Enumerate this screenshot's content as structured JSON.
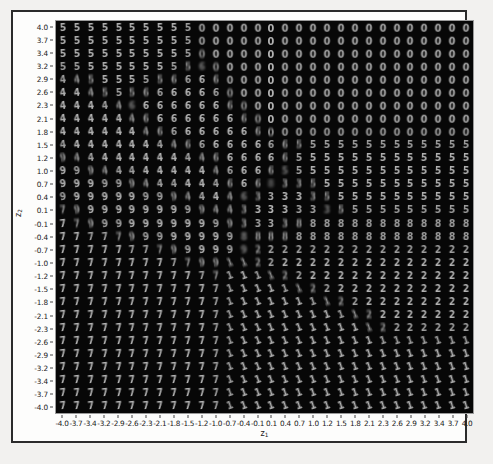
{
  "figure": {
    "background_color": "#fdfdfc",
    "frame_color": "#2b2b2b",
    "plot_background_color": "#000000"
  },
  "axes": {
    "xlabel": "z1",
    "xlabel_base": "z",
    "xlabel_sub": "1",
    "ylabel": "z2",
    "ylabel_base": "z",
    "ylabel_sub": "2"
  },
  "chart_data": {
    "type": "heatmap",
    "title": "",
    "subtitle": "",
    "xlabel": "z1",
    "ylabel": "z2",
    "grid": false,
    "legend": "none",
    "xlim": [
      -4.0,
      4.0
    ],
    "ylim": [
      -4.0,
      4.0
    ],
    "rows": 30,
    "cols": 30,
    "x_tick_labels": [
      "-4.0",
      "-3.7",
      "-3.4",
      "-3.2",
      "-2.9",
      "-2.6",
      "-2.3",
      "-2.1",
      "-1.8",
      "-1.5",
      "-1.2",
      "-1.0",
      "-0.7",
      "-0.4",
      "-0.1",
      "0.1",
      "0.4",
      "0.7",
      "1.0",
      "1.2",
      "1.5",
      "1.8",
      "2.1",
      "2.3",
      "2.6",
      "2.9",
      "3.2",
      "3.4",
      "3.7",
      "4.0"
    ],
    "y_tick_labels": [
      "4.0",
      "3.7",
      "3.4",
      "3.2",
      "2.9",
      "2.6",
      "2.3",
      "2.1",
      "1.8",
      "1.5",
      "1.2",
      "1.0",
      "0.7",
      "0.4",
      "0.1",
      "-0.1",
      "-0.4",
      "-0.7",
      "-1.0",
      "-1.2",
      "-1.5",
      "-1.8",
      "-2.1",
      "-2.3",
      "-2.6",
      "-2.9",
      "-3.2",
      "-3.4",
      "-3.7",
      "-4.0"
    ],
    "x_tick_values": [
      -4.0,
      -3.7,
      -3.4,
      -3.2,
      -2.9,
      -2.6,
      -2.3,
      -2.1,
      -1.8,
      -1.5,
      -1.2,
      -1.0,
      -0.7,
      -0.4,
      -0.1,
      0.1,
      0.4,
      0.7,
      1.0,
      1.2,
      1.5,
      1.8,
      2.1,
      2.3,
      2.6,
      2.9,
      3.2,
      3.4,
      3.7,
      4.0
    ],
    "y_tick_values": [
      4.0,
      3.7,
      3.4,
      3.2,
      2.9,
      2.6,
      2.3,
      2.1,
      1.8,
      1.5,
      1.2,
      1.0,
      0.7,
      0.4,
      0.1,
      -0.1,
      -0.4,
      -0.7,
      -1.0,
      -1.2,
      -1.5,
      -1.8,
      -2.1,
      -2.3,
      -2.6,
      -2.9,
      -3.2,
      -3.4,
      -3.7,
      -4.0
    ],
    "digit_grid": [
      [
        "5",
        "5",
        "5",
        "5",
        "5",
        "5",
        "5",
        "5",
        "5",
        "5",
        "0",
        "0",
        "0",
        "0",
        "0",
        "0",
        "0",
        "0",
        "0",
        "0",
        "0",
        "0",
        "0",
        "0",
        "0",
        "0",
        "0",
        "0",
        "0",
        "0"
      ],
      [
        "5",
        "5",
        "5",
        "5",
        "5",
        "5",
        "5",
        "5",
        "5",
        "5",
        "0",
        "0",
        "0",
        "0",
        "0",
        "0",
        "0",
        "0",
        "0",
        "0",
        "0",
        "0",
        "0",
        "0",
        "0",
        "0",
        "0",
        "0",
        "0",
        "0"
      ],
      [
        "5",
        "5",
        "5",
        "5",
        "5",
        "5",
        "5",
        "5",
        "5",
        "5",
        "0",
        "0",
        "0",
        "0",
        "0",
        "0",
        "0",
        "0",
        "0",
        "0",
        "0",
        "0",
        "0",
        "0",
        "0",
        "0",
        "0",
        "0",
        "0",
        "0"
      ],
      [
        "5",
        "5",
        "5",
        "5",
        "5",
        "5",
        "5",
        "5",
        "5",
        "5",
        "6",
        "0",
        "0",
        "0",
        "0",
        "0",
        "0",
        "0",
        "0",
        "0",
        "0",
        "0",
        "0",
        "0",
        "0",
        "0",
        "0",
        "0",
        "0",
        "0"
      ],
      [
        "4",
        "4",
        "5",
        "5",
        "5",
        "5",
        "5",
        "5",
        "6",
        "6",
        "6",
        "6",
        "0",
        "0",
        "0",
        "0",
        "0",
        "0",
        "0",
        "0",
        "0",
        "0",
        "0",
        "0",
        "0",
        "0",
        "0",
        "0",
        "0",
        "0"
      ],
      [
        "4",
        "4",
        "4",
        "5",
        "5",
        "5",
        "6",
        "6",
        "6",
        "6",
        "6",
        "6",
        "0",
        "0",
        "0",
        "0",
        "0",
        "0",
        "0",
        "0",
        "0",
        "0",
        "0",
        "0",
        "0",
        "0",
        "0",
        "0",
        "0",
        "0"
      ],
      [
        "4",
        "4",
        "4",
        "4",
        "4",
        "6",
        "6",
        "6",
        "6",
        "6",
        "6",
        "6",
        "6",
        "0",
        "0",
        "0",
        "0",
        "0",
        "0",
        "0",
        "0",
        "0",
        "0",
        "0",
        "0",
        "0",
        "0",
        "0",
        "0",
        "0"
      ],
      [
        "4",
        "4",
        "4",
        "4",
        "4",
        "4",
        "6",
        "6",
        "6",
        "6",
        "6",
        "6",
        "6",
        "6",
        "0",
        "0",
        "0",
        "0",
        "0",
        "0",
        "0",
        "0",
        "0",
        "0",
        "0",
        "0",
        "0",
        "0",
        "0",
        "0"
      ],
      [
        "4",
        "4",
        "4",
        "4",
        "4",
        "4",
        "4",
        "6",
        "6",
        "6",
        "6",
        "6",
        "6",
        "6",
        "6",
        "0",
        "0",
        "0",
        "0",
        "0",
        "0",
        "0",
        "0",
        "0",
        "0",
        "0",
        "0",
        "0",
        "0",
        "0"
      ],
      [
        "4",
        "4",
        "4",
        "4",
        "4",
        "4",
        "4",
        "4",
        "4",
        "6",
        "6",
        "6",
        "6",
        "6",
        "6",
        "6",
        "6",
        "5",
        "5",
        "5",
        "5",
        "5",
        "5",
        "5",
        "5",
        "5",
        "5",
        "5",
        "5",
        "5"
      ],
      [
        "9",
        "4",
        "4",
        "4",
        "4",
        "4",
        "4",
        "4",
        "4",
        "4",
        "4",
        "6",
        "6",
        "6",
        "6",
        "6",
        "6",
        "5",
        "5",
        "5",
        "5",
        "5",
        "5",
        "5",
        "5",
        "5",
        "5",
        "5",
        "5",
        "5"
      ],
      [
        "9",
        "9",
        "9",
        "4",
        "4",
        "4",
        "4",
        "4",
        "4",
        "4",
        "4",
        "4",
        "6",
        "6",
        "6",
        "6",
        "5",
        "5",
        "5",
        "5",
        "5",
        "5",
        "5",
        "5",
        "5",
        "5",
        "5",
        "5",
        "5",
        "5"
      ],
      [
        "9",
        "9",
        "9",
        "9",
        "9",
        "9",
        "4",
        "4",
        "4",
        "4",
        "4",
        "4",
        "6",
        "6",
        "6",
        "8",
        "3",
        "3",
        "5",
        "5",
        "5",
        "5",
        "5",
        "5",
        "5",
        "5",
        "5",
        "5",
        "5",
        "5"
      ],
      [
        "9",
        "9",
        "9",
        "9",
        "9",
        "9",
        "9",
        "9",
        "9",
        "4",
        "4",
        "4",
        "4",
        "6",
        "3",
        "3",
        "3",
        "3",
        "3",
        "5",
        "5",
        "5",
        "5",
        "5",
        "5",
        "5",
        "5",
        "5",
        "5",
        "5"
      ],
      [
        "7",
        "9",
        "9",
        "9",
        "9",
        "9",
        "9",
        "9",
        "9",
        "9",
        "9",
        "4",
        "4",
        "3",
        "3",
        "3",
        "3",
        "3",
        "3",
        "3",
        "5",
        "5",
        "5",
        "5",
        "5",
        "5",
        "5",
        "5",
        "5",
        "5"
      ],
      [
        "7",
        "7",
        "9",
        "9",
        "9",
        "9",
        "9",
        "9",
        "9",
        "9",
        "9",
        "9",
        "9",
        "3",
        "3",
        "3",
        "3",
        "8",
        "8",
        "8",
        "8",
        "8",
        "8",
        "8",
        "8",
        "8",
        "8",
        "8",
        "8",
        "8"
      ],
      [
        "7",
        "7",
        "7",
        "7",
        "7",
        "9",
        "9",
        "9",
        "9",
        "9",
        "9",
        "9",
        "9",
        "8",
        "8",
        "8",
        "8",
        "8",
        "8",
        "8",
        "8",
        "8",
        "8",
        "8",
        "8",
        "8",
        "8",
        "8",
        "8",
        "8"
      ],
      [
        "7",
        "7",
        "7",
        "7",
        "7",
        "7",
        "7",
        "7",
        "9",
        "9",
        "9",
        "9",
        "9",
        "9",
        "2",
        "2",
        "2",
        "2",
        "2",
        "2",
        "2",
        "2",
        "2",
        "2",
        "2",
        "2",
        "2",
        "2",
        "2",
        "2"
      ],
      [
        "7",
        "7",
        "7",
        "7",
        "7",
        "7",
        "7",
        "7",
        "7",
        "7",
        "9",
        "9",
        "1",
        "1",
        "2",
        "2",
        "2",
        "2",
        "2",
        "2",
        "2",
        "2",
        "2",
        "2",
        "2",
        "2",
        "2",
        "2",
        "2",
        "2"
      ],
      [
        "7",
        "7",
        "7",
        "7",
        "7",
        "7",
        "7",
        "7",
        "7",
        "7",
        "7",
        "7",
        "1",
        "1",
        "1",
        "1",
        "2",
        "2",
        "2",
        "2",
        "2",
        "2",
        "2",
        "2",
        "2",
        "2",
        "2",
        "2",
        "2",
        "2"
      ],
      [
        "7",
        "7",
        "7",
        "7",
        "7",
        "7",
        "7",
        "7",
        "7",
        "7",
        "7",
        "7",
        "1",
        "1",
        "1",
        "1",
        "1",
        "1",
        "2",
        "2",
        "2",
        "2",
        "2",
        "2",
        "2",
        "2",
        "2",
        "2",
        "2",
        "2"
      ],
      [
        "7",
        "7",
        "7",
        "7",
        "7",
        "7",
        "7",
        "7",
        "7",
        "7",
        "7",
        "7",
        "1",
        "1",
        "1",
        "1",
        "1",
        "1",
        "1",
        "1",
        "2",
        "2",
        "2",
        "2",
        "2",
        "2",
        "2",
        "2",
        "2",
        "2"
      ],
      [
        "7",
        "7",
        "7",
        "7",
        "7",
        "7",
        "7",
        "7",
        "7",
        "7",
        "7",
        "7",
        "1",
        "1",
        "1",
        "1",
        "1",
        "1",
        "1",
        "1",
        "1",
        "1",
        "2",
        "2",
        "2",
        "2",
        "2",
        "2",
        "2",
        "2"
      ],
      [
        "7",
        "7",
        "7",
        "7",
        "7",
        "7",
        "7",
        "7",
        "7",
        "7",
        "7",
        "7",
        "1",
        "1",
        "1",
        "1",
        "1",
        "1",
        "1",
        "1",
        "1",
        "1",
        "1",
        "2",
        "2",
        "2",
        "2",
        "2",
        "2",
        "2"
      ],
      [
        "7",
        "7",
        "7",
        "7",
        "7",
        "7",
        "7",
        "7",
        "7",
        "7",
        "7",
        "7",
        "1",
        "1",
        "1",
        "1",
        "1",
        "1",
        "1",
        "1",
        "1",
        "1",
        "1",
        "1",
        "1",
        "1",
        "1",
        "1",
        "1",
        "1"
      ],
      [
        "7",
        "7",
        "7",
        "7",
        "7",
        "7",
        "7",
        "7",
        "7",
        "7",
        "7",
        "7",
        "1",
        "1",
        "1",
        "1",
        "1",
        "1",
        "1",
        "1",
        "1",
        "1",
        "1",
        "1",
        "1",
        "1",
        "1",
        "1",
        "1",
        "1"
      ],
      [
        "7",
        "7",
        "7",
        "7",
        "7",
        "7",
        "7",
        "7",
        "7",
        "7",
        "7",
        "7",
        "1",
        "1",
        "1",
        "1",
        "1",
        "1",
        "1",
        "1",
        "1",
        "1",
        "1",
        "1",
        "1",
        "1",
        "1",
        "1",
        "1",
        "1"
      ],
      [
        "7",
        "7",
        "7",
        "7",
        "7",
        "7",
        "7",
        "7",
        "7",
        "7",
        "7",
        "7",
        "1",
        "1",
        "1",
        "1",
        "1",
        "1",
        "1",
        "1",
        "1",
        "1",
        "1",
        "1",
        "1",
        "1",
        "1",
        "1",
        "1",
        "1"
      ],
      [
        "7",
        "7",
        "7",
        "7",
        "7",
        "7",
        "7",
        "7",
        "7",
        "7",
        "7",
        "7",
        "1",
        "1",
        "1",
        "1",
        "1",
        "1",
        "1",
        "1",
        "1",
        "1",
        "1",
        "1",
        "1",
        "1",
        "1",
        "1",
        "1",
        "1"
      ],
      [
        "7",
        "7",
        "7",
        "7",
        "7",
        "7",
        "7",
        "7",
        "7",
        "7",
        "7",
        "7",
        "1",
        "1",
        "1",
        "1",
        "1",
        "1",
        "1",
        "1",
        "1",
        "1",
        "1",
        "1",
        "1",
        "1",
        "1",
        "1",
        "1",
        "1"
      ]
    ]
  }
}
